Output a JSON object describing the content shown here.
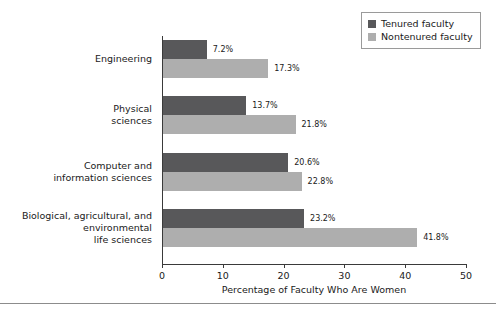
{
  "chart_data": {
    "type": "bar",
    "orientation": "horizontal",
    "title": "",
    "xlabel": "Percentage of Faculty Who Are Women",
    "ylabel": "",
    "xlim": [
      0,
      50
    ],
    "xticks": [
      0,
      10,
      20,
      30,
      40,
      50
    ],
    "grid": false,
    "legend_position": "top-right",
    "categories": [
      "Engineering",
      "Physical\nsciences",
      "Computer and\ninformation sciences",
      "Biological, agricultural, and\nenvironmental\nlife sciences"
    ],
    "series": [
      {
        "name": "Tenured faculty",
        "color": "#58585a",
        "values": [
          7.2,
          13.7,
          20.6,
          23.2
        ],
        "labels": [
          "7.2%",
          "13.7%",
          "20.6%",
          "23.2%"
        ]
      },
      {
        "name": "Nontenured faculty",
        "color": "#aeaeae",
        "values": [
          17.3,
          21.8,
          22.8,
          41.8
        ],
        "labels": [
          "17.3%",
          "21.8%",
          "22.8%",
          "41.8%"
        ]
      }
    ]
  },
  "legend": {
    "items": [
      {
        "label": "Tenured faculty",
        "color": "#58585a"
      },
      {
        "label": "Nontenured faculty",
        "color": "#aeaeae"
      }
    ]
  },
  "axis": {
    "x_title": "Percentage of Faculty Who Are Women",
    "tick_labels": [
      "0",
      "10",
      "20",
      "30",
      "40",
      "50"
    ]
  }
}
